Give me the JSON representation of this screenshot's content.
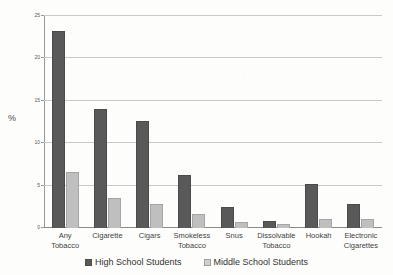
{
  "chart_data": {
    "type": "bar",
    "title": "",
    "xlabel": "",
    "ylabel": "%",
    "ylim": [
      0,
      25
    ],
    "yticks": [
      0,
      5,
      10,
      15,
      20,
      25
    ],
    "grid": true,
    "legend_position": "bottom",
    "categories": [
      "Any\nTobacco",
      "Cigarette",
      "Cigars",
      "Smokeless\nTobacco",
      "Snus",
      "Dissolvable\nTobacco",
      "Hookah",
      "Electronic\nCigarettes"
    ],
    "series": [
      {
        "name": "High School Students",
        "color": "#595959",
        "values": [
          23.2,
          14.0,
          12.6,
          6.3,
          2.5,
          0.8,
          5.2,
          2.8
        ]
      },
      {
        "name": "Middle School Students",
        "color": "#bfbfbf",
        "values": [
          6.6,
          3.5,
          2.8,
          1.7,
          0.7,
          0.5,
          1.1,
          1.1
        ]
      }
    ]
  },
  "ytick_labels": [
    "0",
    "5",
    "10",
    "15",
    "20",
    "25"
  ],
  "legend": [
    {
      "label": "High School Students",
      "swatch": "hs"
    },
    {
      "label": "Middle School Students",
      "swatch": "ms"
    }
  ]
}
